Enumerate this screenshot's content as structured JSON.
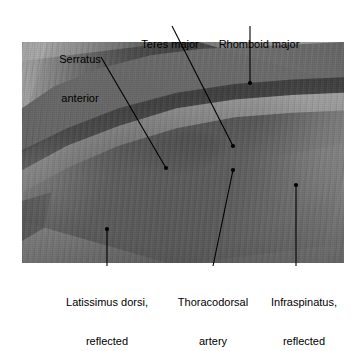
{
  "figure": {
    "type": "anatomical-dissection-photograph",
    "photo": {
      "left": 22,
      "top": 42,
      "width": 322,
      "height": 221,
      "tone": "grayscale"
    },
    "labels": [
      {
        "id": "serratus-anterior",
        "text": "Serratus\nanterior",
        "line1": "Serratus",
        "line2": "anterior",
        "position": "top-left",
        "x": 68,
        "y": 27,
        "leader": {
          "x1": 101,
          "y1": 57,
          "x2": 166,
          "y2": 168
        }
      },
      {
        "id": "teres-major",
        "text": "Teres major",
        "line1": "Teres major",
        "line2": "",
        "position": "top-center",
        "x": 139,
        "y": 12,
        "leader": {
          "x1": 172,
          "y1": 26,
          "x2": 233,
          "y2": 146
        }
      },
      {
        "id": "rhomboid-major",
        "text": "Rhomboid major",
        "line1": "Rhomboid major",
        "line2": "",
        "position": "top-right",
        "x": 214,
        "y": 12,
        "leader": {
          "x1": 250,
          "y1": 26,
          "x2": 250,
          "y2": 83
        }
      },
      {
        "id": "latissimus-dorsi-reflected",
        "text": "Latissimus dorsi,\nreflected",
        "line1": "Latissimus dorsi,",
        "line2": "reflected",
        "position": "bottom-left",
        "x": 61,
        "y": 270,
        "leader": {
          "x1": 107,
          "y1": 229,
          "x2": 107,
          "y2": 266
        }
      },
      {
        "id": "thoracodorsal-artery",
        "text": "Thoracodorsal\nartery",
        "line1": "Thoracodorsal",
        "line2": "artery",
        "position": "bottom-center",
        "x": 175,
        "y": 270,
        "leader": {
          "x1": 233,
          "y1": 170,
          "x2": 213,
          "y2": 266
        }
      },
      {
        "id": "infraspinatus-reflected",
        "text": "Infraspinatus,\nreflected",
        "line1": "Infraspinatus,",
        "line2": "reflected",
        "position": "bottom-right",
        "x": 265,
        "y": 270,
        "leader": {
          "x1": 296,
          "y1": 185,
          "x2": 296,
          "y2": 266
        }
      }
    ],
    "colors": {
      "background": "#ffffff",
      "text": "#000000",
      "leader": "#000000",
      "photo_light": "#cfcdc6",
      "photo_mid": "#9a9a98",
      "photo_dark": "#201f1d"
    }
  }
}
